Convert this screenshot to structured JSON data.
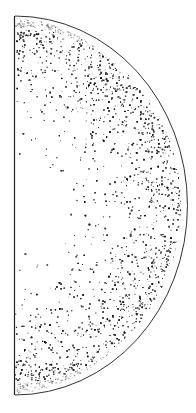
{
  "figure": {
    "colors": {
      "background": "#ffffff",
      "ink": "#1a1a1a",
      "rim_gray": "#9a9a9a"
    },
    "geometry": {
      "flat_edge_x": 14,
      "top_y": 16,
      "bottom_y": 395,
      "arc_apex_x": 186,
      "center_y": 205
    }
  }
}
